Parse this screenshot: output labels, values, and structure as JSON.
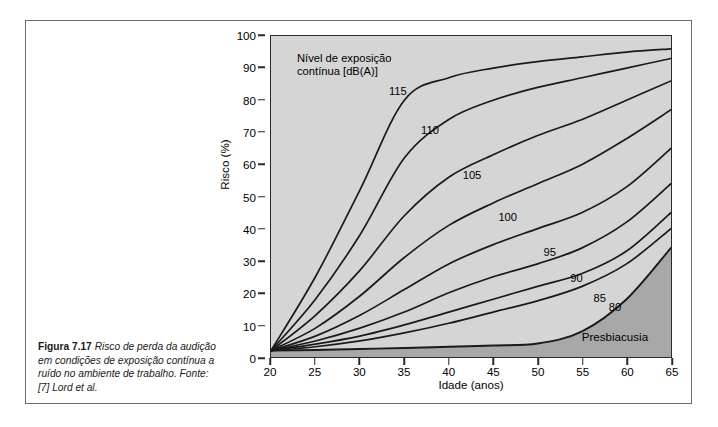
{
  "figure": {
    "caption_lead": "Figura 7.17",
    "caption_text": "Risco de perda da audição em condições de exposição contínua a ruído no ambiente de trabalho. Fonte: [7] Lord et al."
  },
  "chart_data": {
    "type": "line",
    "title": "",
    "xlabel": "Idade (anos)",
    "ylabel": "Risco (%)",
    "xlim": [
      20,
      65
    ],
    "ylim": [
      0,
      100
    ],
    "xticks": [
      20,
      25,
      30,
      35,
      40,
      45,
      50,
      55,
      60,
      65
    ],
    "yticks": [
      0,
      10,
      20,
      30,
      40,
      50,
      60,
      70,
      80,
      90,
      100
    ],
    "grid": false,
    "legend_position": "inline-curve-labels",
    "legend_title": "Nível de exposição contínua [dB(A)]",
    "legend_title_line1": "Nível de exposição",
    "legend_title_line2": "contínua [dB(A)]",
    "annotations": [
      {
        "text": "Presbiacusia",
        "x": 58.5,
        "y": 7
      }
    ],
    "plot_bg_color": "#d5d5d5",
    "shaded_region_color": "#a8a8a8",
    "shaded_region_name": "Presbiacusia",
    "line_color": "#1a1a1a",
    "x": [
      20,
      25,
      30,
      35,
      40,
      45,
      50,
      55,
      60,
      65
    ],
    "series": [
      {
        "name": "115",
        "label": "115",
        "label_x": 34.2,
        "label_y": 83,
        "values": [
          2,
          25,
          52,
          80,
          87,
          90,
          92,
          93.5,
          95,
          96
        ]
      },
      {
        "name": "110",
        "label": "110",
        "label_x": 37.8,
        "label_y": 71,
        "values": [
          2,
          18,
          38,
          62,
          74,
          80,
          84,
          87,
          90,
          93
        ]
      },
      {
        "name": "105",
        "label": "105",
        "label_x": 42.5,
        "label_y": 57,
        "values": [
          2,
          13,
          27,
          44,
          56,
          63,
          69,
          74,
          80,
          86
        ]
      },
      {
        "name": "100",
        "label": "100",
        "label_x": 46.5,
        "label_y": 44,
        "values": [
          2,
          9,
          19,
          31,
          41,
          48,
          54,
          60,
          68,
          77
        ]
      },
      {
        "name": "95",
        "label": "95",
        "label_x": 51.2,
        "label_y": 33,
        "values": [
          2,
          6.5,
          13,
          21,
          29,
          35,
          40,
          45,
          53,
          65
        ]
      },
      {
        "name": "90",
        "label": "90",
        "label_x": 54.2,
        "label_y": 25,
        "values": [
          2,
          5,
          9,
          14,
          20,
          25,
          29,
          34,
          42,
          54
        ]
      },
      {
        "name": "85",
        "label": "85",
        "label_x": 56.8,
        "label_y": 19,
        "values": [
          2,
          4,
          6.5,
          10,
          14,
          18,
          22,
          26,
          33,
          45
        ]
      },
      {
        "name": "80",
        "label": "80",
        "label_x": 58.5,
        "label_y": 16,
        "values": [
          2,
          3.2,
          5,
          7.5,
          10.5,
          14,
          17.5,
          22,
          29,
          40
        ]
      },
      {
        "name": "presbiacusia-boundary",
        "label": "",
        "label_x": null,
        "label_y": null,
        "values": [
          2,
          2.2,
          2.5,
          2.8,
          3.2,
          3.6,
          4.2,
          8,
          18,
          34
        ]
      }
    ]
  }
}
